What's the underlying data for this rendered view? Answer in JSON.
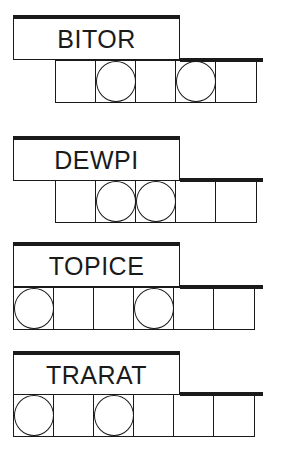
{
  "puzzles": [
    {
      "scrambled": "BITOR",
      "letter_count": 5,
      "circled_positions": [
        2,
        4
      ]
    },
    {
      "scrambled": "DEWPI",
      "letter_count": 5,
      "circled_positions": [
        2,
        3
      ]
    },
    {
      "scrambled": "TOPICE",
      "letter_count": 6,
      "circled_positions": [
        1,
        4
      ]
    },
    {
      "scrambled": "TRARAT",
      "letter_count": 6,
      "circled_positions": [
        1,
        3
      ]
    }
  ]
}
